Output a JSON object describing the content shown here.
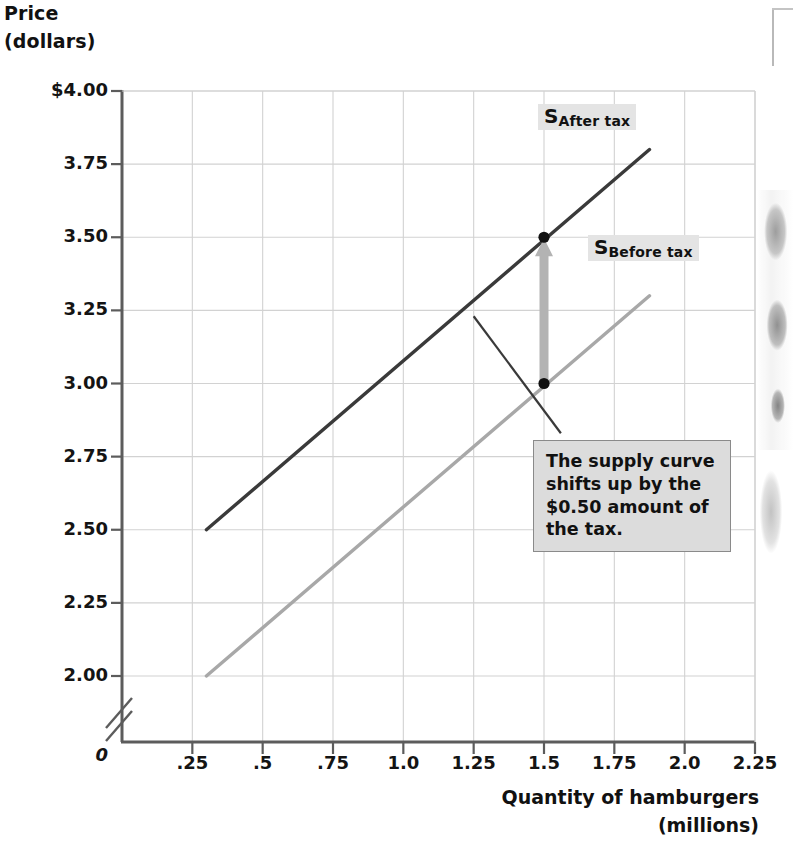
{
  "figure": {
    "y_axis_title_line1": "Price",
    "y_axis_title_line2": "(dollars)",
    "x_axis_title_line1": "Quantity of hamburgers",
    "x_axis_title_line2": "(millions)",
    "zero_label": "0",
    "annotation_text": "The supply curve shifts up by the $0.50 amount of the tax.",
    "label_after_tax_base": "S",
    "label_after_tax_sub": "After tax",
    "label_before_tax_base": "S",
    "label_before_tax_sub": "Before tax",
    "colors": {
      "after_tax_curve": "#3a3a3a",
      "before_tax_curve": "#a8a8a8",
      "arrow": "#b3b3b3",
      "gridline": "#d2d2d2",
      "axis": "#5c5c5c",
      "label_background": "#e4e4e4",
      "callout_background": "#dcdcdc",
      "callout_border": "#8a8a8a",
      "point_marker": "#111111"
    }
  },
  "chart_data": {
    "type": "line",
    "title": "",
    "subtitle": "",
    "xlabel": "Quantity of hamburgers (millions)",
    "ylabel": "Price (dollars)",
    "xlim": [
      0,
      2.25
    ],
    "ylim": [
      2.0,
      4.0
    ],
    "y_axis_break": true,
    "y_axis_break_note": "axis broken between 0 and 2.00",
    "grid": true,
    "legend": "inline-curve-labels",
    "xticks": [
      0.25,
      0.5,
      0.75,
      1.0,
      1.25,
      1.5,
      1.75,
      2.0,
      2.25
    ],
    "xtick_labels": [
      ".25",
      ".5",
      ".75",
      "1.0",
      "1.25",
      "1.5",
      "1.75",
      "2.0",
      "2.25"
    ],
    "yticks": [
      2.0,
      2.25,
      2.5,
      2.75,
      3.0,
      3.25,
      3.5,
      3.75,
      4.0
    ],
    "ytick_labels": [
      "2.00",
      "2.25",
      "2.50",
      "2.75",
      "3.00",
      "3.25",
      "3.50",
      "3.75",
      "$4.00"
    ],
    "series": [
      {
        "name": "S Before tax",
        "color": "#a8a8a8",
        "x": [
          0.3,
          1.875
        ],
        "y": [
          2.0,
          3.3
        ]
      },
      {
        "name": "S After tax",
        "color": "#3a3a3a",
        "x": [
          0.3,
          1.875
        ],
        "y": [
          2.5,
          3.8
        ]
      }
    ],
    "points": [
      {
        "label": "before-tax point",
        "x": 1.5,
        "y": 3.0
      },
      {
        "label": "after-tax point",
        "x": 1.5,
        "y": 3.5
      }
    ],
    "annotations": [
      {
        "type": "arrow",
        "text": "",
        "x": 1.5,
        "y_from": 3.0,
        "y_to": 3.5,
        "color": "#b3b3b3"
      },
      {
        "type": "callout",
        "text": "The supply curve shifts up by the $0.50 amount of the tax.",
        "leader_from_x": 1.25,
        "leader_from_y": 3.23,
        "leader_to_x": 1.56,
        "leader_to_y": 2.83
      },
      {
        "type": "curve-label",
        "text": "S After tax",
        "x": 1.72,
        "y": 3.86
      },
      {
        "type": "curve-label",
        "text": "S Before tax",
        "x": 1.9,
        "y": 3.41
      }
    ]
  }
}
